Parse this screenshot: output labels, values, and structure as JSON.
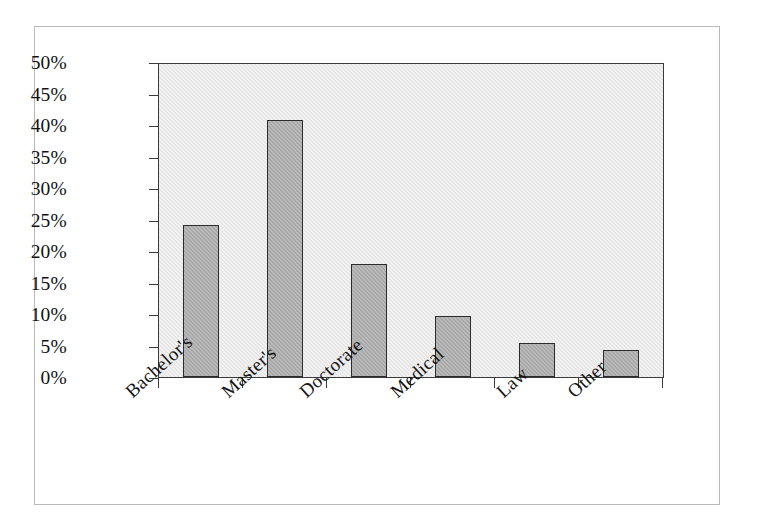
{
  "figure": {
    "name": "bar-chart-degree-distribution",
    "background_color": "#ffffff",
    "frame_color": "#b9b9b9",
    "plot_background_color": "#e9e9e9",
    "bar_fill_color": "#a9a9a9",
    "bar_edge_color": "#2c2c2c",
    "axis_color": "#3b3b3b"
  },
  "chart_data": {
    "type": "bar",
    "title": "",
    "subtitle": "",
    "xlabel": "",
    "ylabel": "",
    "categories": [
      "Bachelor's",
      "Master's",
      "Doctorate",
      "Medical",
      "Law",
      "Other"
    ],
    "values": [
      24.3,
      41.0,
      18.0,
      9.8,
      5.4,
      4.3
    ],
    "value_labels": [
      "24.3%",
      "41.0%",
      "18.0%",
      "9.8%",
      "5.4%",
      "4.3%"
    ],
    "ylim": [
      0,
      50
    ],
    "ytick_values": [
      0,
      5,
      10,
      15,
      20,
      25,
      30,
      35,
      40,
      45,
      50
    ],
    "ytick_labels": [
      "0%",
      "5%",
      "10%",
      "15%",
      "20%",
      "25%",
      "30%",
      "35%",
      "40%",
      "45%",
      "50%"
    ],
    "grid": false,
    "legend": null,
    "legend_position": "none",
    "annotations": [],
    "xtick_label_rotation": -42,
    "series": [
      {
        "name": "Share of degrees",
        "values": [
          24.3,
          41.0,
          18.0,
          9.8,
          5.4,
          4.3
        ]
      }
    ]
  }
}
